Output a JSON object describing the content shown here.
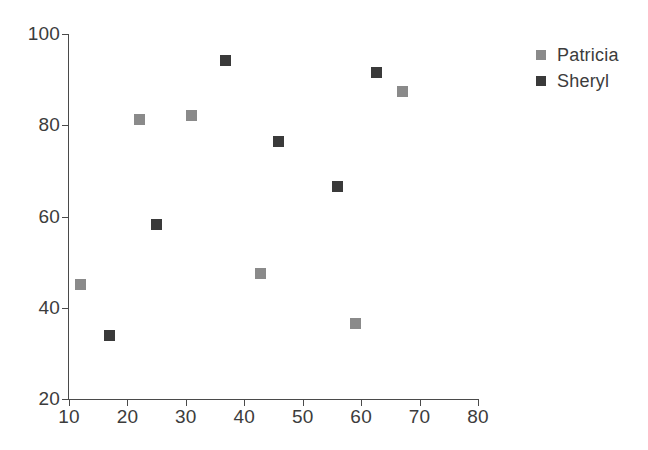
{
  "chart_data": {
    "type": "scatter",
    "title": "",
    "xlabel": "",
    "ylabel": "",
    "xlim": [
      10,
      80
    ],
    "ylim": [
      20,
      100
    ],
    "xticks": [
      10,
      20,
      30,
      40,
      50,
      60,
      70,
      80
    ],
    "yticks": [
      20,
      40,
      60,
      80,
      100
    ],
    "grid": false,
    "legend_position": "right",
    "series": [
      {
        "name": "Patricia",
        "color": "#8a8a8a",
        "marker": "square",
        "points": [
          {
            "x": 12.0,
            "y": 45.0
          },
          {
            "x": 22.0,
            "y": 81.3
          },
          {
            "x": 31.0,
            "y": 82.2
          },
          {
            "x": 42.7,
            "y": 47.5
          },
          {
            "x": 59.0,
            "y": 36.5
          },
          {
            "x": 67.0,
            "y": 87.5
          }
        ]
      },
      {
        "name": "Sheryl",
        "color": "#3a3a3a",
        "marker": "square",
        "points": [
          {
            "x": 17.0,
            "y": 34.0
          },
          {
            "x": 25.0,
            "y": 58.3
          },
          {
            "x": 36.8,
            "y": 94.3
          },
          {
            "x": 45.9,
            "y": 76.5
          },
          {
            "x": 56.0,
            "y": 66.5
          },
          {
            "x": 62.7,
            "y": 91.5
          }
        ]
      }
    ]
  },
  "axes": {
    "line_color": "#4a4a4a",
    "text_color": "#3c3c3c"
  },
  "legend": {
    "entries": [
      {
        "label": "Patricia",
        "color": "#8a8a8a"
      },
      {
        "label": "Sheryl",
        "color": "#3a3a3a"
      }
    ]
  }
}
